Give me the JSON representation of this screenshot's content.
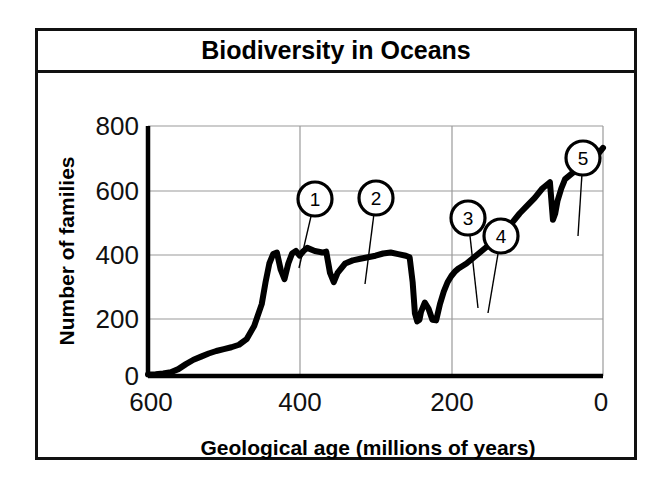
{
  "figure": {
    "title": "Biodiversity in Oceans"
  },
  "chart_data": {
    "type": "line",
    "title": "Biodiversity in Oceans",
    "xlabel": "Geological age (millions of years)",
    "ylabel": "Number of families",
    "xlim": [
      600,
      0
    ],
    "ylim": [
      0,
      800
    ],
    "x_ticks": [
      "600",
      "400",
      "200",
      "0"
    ],
    "x_tick_values": [
      600,
      400,
      200,
      0
    ],
    "y_ticks": [
      "0",
      "200",
      "400",
      "600",
      "800"
    ],
    "y_tick_values": [
      0,
      200,
      400,
      600,
      800
    ],
    "x_axis_reversed": true,
    "grid": true,
    "legend": "none",
    "line_color": "#000000",
    "series": [
      {
        "name": "Number of marine families",
        "x": [
          600,
          590,
          580,
          570,
          560,
          550,
          540,
          530,
          520,
          510,
          500,
          490,
          480,
          470,
          460,
          450,
          445,
          440,
          435,
          430,
          425,
          420,
          415,
          410,
          405,
          400,
          395,
          390,
          380,
          370,
          365,
          360,
          355,
          350,
          340,
          330,
          320,
          310,
          300,
          290,
          280,
          270,
          260,
          255,
          251,
          248,
          245,
          242,
          240,
          235,
          230,
          225,
          220,
          215,
          210,
          205,
          200,
          195,
          190,
          180,
          170,
          160,
          150,
          140,
          130,
          120,
          110,
          100,
          90,
          80,
          70,
          66,
          63,
          60,
          55,
          50,
          40,
          30,
          20,
          10,
          0
        ],
        "y": [
          5,
          6,
          8,
          12,
          22,
          38,
          52,
          62,
          72,
          80,
          86,
          92,
          100,
          118,
          160,
          230,
          300,
          360,
          390,
          395,
          340,
          310,
          360,
          392,
          400,
          385,
          400,
          410,
          400,
          395,
          398,
          330,
          300,
          330,
          360,
          370,
          375,
          380,
          385,
          392,
          395,
          390,
          385,
          380,
          300,
          200,
          175,
          180,
          205,
          235,
          215,
          180,
          178,
          230,
          270,
          300,
          320,
          335,
          345,
          360,
          380,
          400,
          420,
          440,
          470,
          490,
          520,
          545,
          570,
          600,
          620,
          500,
          520,
          560,
          600,
          630,
          650,
          665,
          680,
          700,
          730
        ],
        "note": "Curve rises from near zero at 600 Ma, plateaus near 380-420 through the Paleozoic, crashes to ~175 at the Permian-Triassic boundary, then rises to ~730 families at present."
      }
    ],
    "annotations": [
      {
        "id": "1",
        "label": "1",
        "circle_x": 280,
        "circle_y": 168,
        "point_x": 264,
        "point_y": 237,
        "description": "Late Ordovician extinction dip"
      },
      {
        "id": "2",
        "label": "2",
        "circle_x": 341,
        "circle_y": 167,
        "point_x": 330,
        "point_y": 253,
        "description": "Late Devonian extinction dip"
      },
      {
        "id": "3",
        "label": "3",
        "circle_x": 433,
        "circle_y": 187,
        "point_x": 443,
        "point_y": 277,
        "description": "Permian-Triassic extinction dip"
      },
      {
        "id": "4",
        "label": "4",
        "circle_x": 466,
        "circle_y": 205,
        "point_x": 453,
        "point_y": 282,
        "description": "End-Triassic extinction dip"
      },
      {
        "id": "5",
        "label": "5",
        "circle_x": 548,
        "circle_y": 127,
        "point_x": 543,
        "point_y": 205,
        "description": "Cretaceous-Paleogene extinction dip"
      }
    ]
  }
}
